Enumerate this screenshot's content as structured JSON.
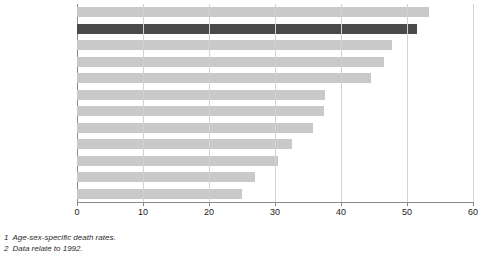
{
  "chart_data": {
    "type": "bar",
    "orientation": "horizontal",
    "title": "",
    "xlabel": "",
    "ylabel": "",
    "xlim": [
      0,
      60
    ],
    "xticks": [
      0,
      10,
      20,
      30,
      40,
      50,
      60
    ],
    "grid": true,
    "legend": null,
    "highlight_category": "United Kingdom",
    "colors": {
      "bar": "#c9c9c9",
      "highlight_bar": "#4a4a4a",
      "gridline": "#d2d2d2",
      "axis": "#8a8a8a",
      "text": "#1a1a1a"
    },
    "categories": [
      "Denmark",
      "United Kingdom",
      "Belgium",
      "Netherlands",
      "Germany",
      "Irish Republic",
      "Italy",
      "France",
      "Luxembourg",
      "Portugal",
      "Spain",
      "Greece"
    ],
    "category_footnote_markers": [
      "2",
      "2",
      "3",
      "",
      "4",
      "",
      "5",
      "",
      "2",
      "2",
      "5",
      ""
    ],
    "values": [
      53.3,
      51.5,
      47.8,
      46.5,
      44.5,
      37.5,
      37.4,
      35.8,
      32.6,
      30.5,
      27.0,
      25.0
    ]
  },
  "footnotes": [
    {
      "num": "1",
      "text": "Age-sex-specific death rates."
    },
    {
      "num": "2",
      "text": "Data relate to 1992."
    }
  ]
}
